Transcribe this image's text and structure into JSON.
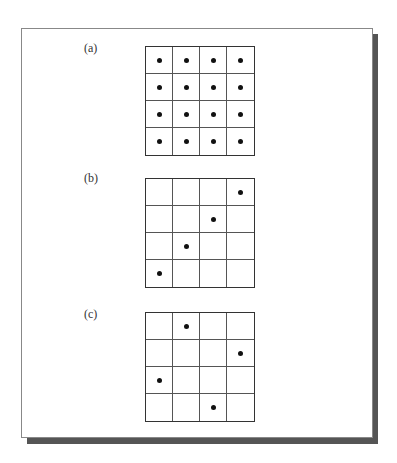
{
  "figure": {
    "panels": [
      {
        "label": "(a)",
        "rows": 4,
        "cols": 4,
        "dots": [
          [
            0,
            0
          ],
          [
            0,
            1
          ],
          [
            0,
            2
          ],
          [
            0,
            3
          ],
          [
            1,
            0
          ],
          [
            1,
            1
          ],
          [
            1,
            2
          ],
          [
            1,
            3
          ],
          [
            2,
            0
          ],
          [
            2,
            1
          ],
          [
            2,
            2
          ],
          [
            2,
            3
          ],
          [
            3,
            0
          ],
          [
            3,
            1
          ],
          [
            3,
            2
          ],
          [
            3,
            3
          ]
        ]
      },
      {
        "label": "(b)",
        "rows": 4,
        "cols": 4,
        "dots": [
          [
            0,
            3
          ],
          [
            1,
            2
          ],
          [
            2,
            1
          ],
          [
            3,
            0
          ]
        ]
      },
      {
        "label": "(c)",
        "rows": 4,
        "cols": 4,
        "dots": [
          [
            0,
            1
          ],
          [
            1,
            3
          ],
          [
            2,
            0
          ],
          [
            3,
            2
          ]
        ]
      }
    ],
    "colors": {
      "grid_line": "#333333",
      "dot": "#111111",
      "shadow": "#555555",
      "background": "#ffffff"
    }
  }
}
